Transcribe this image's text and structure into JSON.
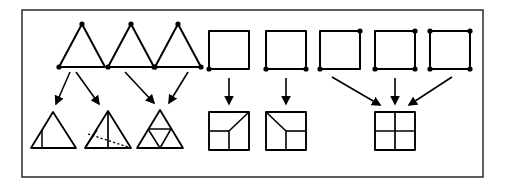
{
  "figure": {
    "caption": "",
    "colors": {
      "ink": "#000000",
      "background": "#ffffff",
      "frame": "#1a1a1a"
    },
    "frame": {
      "name": "outer-border",
      "x": 22,
      "y": 10,
      "width": 461,
      "height": 167,
      "stroke_width": 1.4
    },
    "geometry": {
      "stroke_width_shape": 2.0,
      "stroke_width_subdivision": 1.5,
      "stroke_width_arrow": 1.6,
      "dot_radius": 2.6,
      "dashed_pattern": "2.2,2.2"
    },
    "groups": [
      {
        "id": "triangle-group",
        "label": "triangle refinement group",
        "top_shapes": [
          {
            "id": "triangle-top-1",
            "kind": "triangle",
            "marked_vertices": [
              "apex",
              "bottom-left"
            ],
            "dot_count": 2,
            "points": "82,24 59,67 105,67",
            "dots": [
              {
                "name": "apex",
                "x": 82,
                "y": 24
              },
              {
                "name": "bottom-left",
                "x": 59,
                "y": 67
              }
            ]
          },
          {
            "id": "triangle-top-2",
            "kind": "triangle",
            "marked_vertices": [
              "apex",
              "bottom-left",
              "bottom-right"
            ],
            "dot_count": 3,
            "points": "131,24 108,67 154,67",
            "dots": [
              {
                "name": "apex",
                "x": 131,
                "y": 24
              },
              {
                "name": "bottom-left",
                "x": 108,
                "y": 67
              },
              {
                "name": "bottom-right",
                "x": 154,
                "y": 67
              }
            ]
          },
          {
            "id": "triangle-top-3",
            "kind": "triangle",
            "marked_vertices": [
              "apex",
              "bottom-left",
              "bottom-right"
            ],
            "dot_count": 3,
            "points": "178,24 155,67 201,67",
            "dots": [
              {
                "name": "apex",
                "x": 178,
                "y": 24
              },
              {
                "name": "bottom-left",
                "x": 155,
                "y": 67
              },
              {
                "name": "bottom-right",
                "x": 201,
                "y": 67
              }
            ]
          }
        ],
        "bottom_shapes": [
          {
            "id": "triangle-bottom-1",
            "kind": "triangle-bisected",
            "description": "triangle split by one median into two parts",
            "points": "53,112 31,148 76,148",
            "subdivisions": [
              "42,130 42,148"
            ]
          },
          {
            "id": "triangle-bottom-2",
            "kind": "triangle-with-dashed",
            "description": "triangle with vertical median and dashed interior chord",
            "points": "108,111 85,148 131,148",
            "subdivisions": [
              "108,111 108,148"
            ],
            "dashed": [
              "88,134 128,147"
            ],
            "extra": [
              "85,148 97,130"
            ]
          },
          {
            "id": "triangle-bottom-3",
            "kind": "triangle-4-subdivided",
            "description": "triangle split into four congruent sub-triangles by midlines",
            "points": "160,110 137,148 183,148",
            "subdivisions": [
              "148,129 171,129",
              "148,129 160,148",
              "171,129 160,148"
            ]
          }
        ],
        "arrows": [
          {
            "id": "tri-arrow-1",
            "from": "triangle-top-1",
            "to": "triangle-bottom-1",
            "path": "70,72 56,106"
          },
          {
            "id": "tri-arrow-2",
            "from": "triangle-top-1",
            "to": "triangle-bottom-2",
            "path": "76,72 99,106"
          },
          {
            "id": "tri-arrow-3",
            "from": "triangle-top-2",
            "to": "triangle-bottom-3",
            "path": "125,72 155,105"
          },
          {
            "id": "tri-arrow-4",
            "from": "triangle-top-3",
            "to": "triangle-bottom-3",
            "path": "188,72 168,105"
          }
        ]
      },
      {
        "id": "square-pair-group",
        "label": "square partial refinement group",
        "top_shapes": [
          {
            "id": "square-top-1",
            "kind": "square",
            "marked_vertices": [
              "bottom-left"
            ],
            "dot_count": 1,
            "rect": {
              "x": 209,
              "y": 31,
              "width": 40,
              "height": 38
            },
            "dots": [
              {
                "name": "bottom-left",
                "x": 209,
                "y": 69
              }
            ]
          },
          {
            "id": "square-top-2",
            "kind": "square",
            "marked_vertices": [
              "bottom-left",
              "bottom-right"
            ],
            "dot_count": 2,
            "rect": {
              "x": 266,
              "y": 31,
              "width": 40,
              "height": 38
            },
            "dots": [
              {
                "name": "bottom-left",
                "x": 266,
                "y": 69
              },
              {
                "name": "bottom-right",
                "x": 306,
                "y": 69
              }
            ]
          }
        ],
        "bottom_shapes": [
          {
            "id": "square-bottom-1",
            "kind": "square-partial-refined",
            "description": "square with lower-left quadrant split and diagonal to upper-right corner",
            "rect": {
              "x": 209,
              "y": 112,
              "width": 40,
              "height": 38
            },
            "subdivisions": [
              "209,131 229,131",
              "229,131 229,150",
              "229,131 249,112"
            ]
          },
          {
            "id": "square-bottom-2",
            "kind": "square-partial-refined",
            "description": "square with diagonal from upper-left corner to centre and lower half split",
            "rect": {
              "x": 266,
              "y": 112,
              "width": 40,
              "height": 38
            },
            "subdivisions": [
              "266,112 286,131",
              "286,131 306,131",
              "286,131 286,150"
            ]
          }
        ],
        "arrows": [
          {
            "id": "sq-arrow-1",
            "from": "square-top-1",
            "to": "square-bottom-1",
            "path": "229,77 229,106"
          },
          {
            "id": "sq-arrow-2",
            "from": "square-top-2",
            "to": "square-bottom-2",
            "path": "286,77 286,106"
          }
        ]
      },
      {
        "id": "square-converge-group",
        "label": "square full refinement convergence group",
        "top_shapes": [
          {
            "id": "square-top-3",
            "kind": "square",
            "marked_vertices": [
              "bottom-left",
              "top-right"
            ],
            "dot_count": 2,
            "rect": {
              "x": 320,
              "y": 31,
              "width": 40,
              "height": 38
            },
            "dots": [
              {
                "name": "bottom-left",
                "x": 320,
                "y": 69
              },
              {
                "name": "top-right",
                "x": 360,
                "y": 31
              }
            ]
          },
          {
            "id": "square-top-4",
            "kind": "square",
            "marked_vertices": [
              "bottom-left",
              "bottom-right",
              "top-right"
            ],
            "dot_count": 3,
            "rect": {
              "x": 375,
              "y": 31,
              "width": 40,
              "height": 38
            },
            "dots": [
              {
                "name": "bottom-left",
                "x": 375,
                "y": 69
              },
              {
                "name": "bottom-right",
                "x": 415,
                "y": 69
              },
              {
                "name": "top-right",
                "x": 415,
                "y": 31
              }
            ]
          },
          {
            "id": "square-top-5",
            "kind": "square",
            "marked_vertices": [
              "top-left",
              "top-right",
              "bottom-left",
              "bottom-right"
            ],
            "dot_count": 4,
            "rect": {
              "x": 430,
              "y": 31,
              "width": 40,
              "height": 38
            },
            "dots": [
              {
                "name": "top-left",
                "x": 430,
                "y": 31
              },
              {
                "name": "top-right",
                "x": 470,
                "y": 31
              },
              {
                "name": "bottom-left",
                "x": 430,
                "y": 69
              },
              {
                "name": "bottom-right",
                "x": 470,
                "y": 69
              }
            ]
          }
        ],
        "bottom_shapes": [
          {
            "id": "square-bottom-3",
            "kind": "square-4-quadrants",
            "description": "square uniformly split into four equal quadrants",
            "rect": {
              "x": 375,
              "y": 112,
              "width": 40,
              "height": 38
            },
            "subdivisions": [
              "395,112 395,150",
              "375,131 415,131"
            ]
          }
        ],
        "arrows": [
          {
            "id": "sq-arrow-3",
            "from": "square-top-3",
            "to": "square-bottom-3",
            "path": "332,77 382,106"
          },
          {
            "id": "sq-arrow-4",
            "from": "square-top-4",
            "to": "square-bottom-3",
            "path": "395,77 395,106"
          },
          {
            "id": "sq-arrow-5",
            "from": "square-top-5",
            "to": "square-bottom-3",
            "path": "452,77 407,106"
          }
        ]
      }
    ]
  }
}
